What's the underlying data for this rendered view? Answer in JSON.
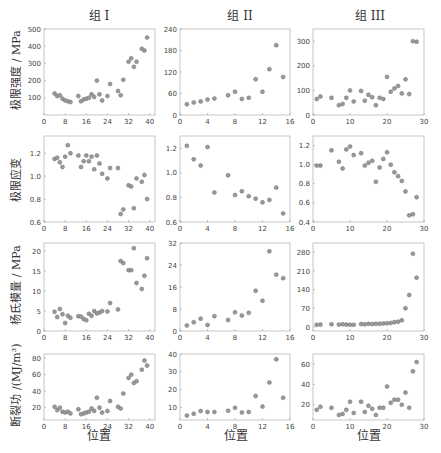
{
  "figure": {
    "column_titles": [
      "组 I",
      "组 II",
      "组 III"
    ],
    "row_labels": [
      "极限强度 / MPa",
      "极限应变",
      "杨氏模量 / MPa",
      "断裂功 /(MJ/m³)"
    ],
    "xlabel": "位置",
    "marker_color": "#9a9a9a",
    "frame_color": "#b8b8b8"
  },
  "chart_data": [
    {
      "type": "scatter",
      "panel": "组I-极限强度",
      "row": 0,
      "col": 0,
      "title": "组 I",
      "xlabel": "",
      "ylabel": "极限强度 / MPa",
      "xlim": [
        0,
        42
      ],
      "ylim": [
        0,
        500
      ],
      "xticks": [
        0,
        8,
        16,
        24,
        32,
        40
      ],
      "yticks": [
        100,
        200,
        300,
        400,
        500
      ],
      "x": [
        4,
        5,
        6,
        7,
        8,
        9,
        10,
        13,
        14,
        15,
        16,
        17,
        18,
        19,
        20,
        21,
        22,
        24,
        25,
        28,
        29,
        30,
        32,
        33,
        34,
        35,
        37,
        38,
        39
      ],
      "y": [
        125,
        110,
        115,
        95,
        85,
        80,
        75,
        110,
        80,
        90,
        95,
        100,
        120,
        105,
        200,
        120,
        85,
        110,
        180,
        140,
        115,
        205,
        310,
        330,
        280,
        310,
        385,
        375,
        450
      ]
    },
    {
      "type": "scatter",
      "panel": "组II-极限强度",
      "row": 0,
      "col": 1,
      "title": "组 II",
      "xlabel": "",
      "ylabel": "",
      "xlim": [
        0,
        16
      ],
      "ylim": [
        0,
        240
      ],
      "xticks": [
        0,
        4,
        8,
        12,
        16
      ],
      "yticks": [
        0,
        60,
        120,
        180,
        240
      ],
      "x": [
        1,
        2,
        3,
        4,
        5,
        7,
        8,
        9,
        10,
        11,
        12,
        13,
        14,
        15
      ],
      "y": [
        30,
        35,
        38,
        43,
        46,
        55,
        65,
        45,
        48,
        100,
        65,
        128,
        195,
        106
      ]
    },
    {
      "type": "scatter",
      "panel": "组III-极限强度",
      "row": 0,
      "col": 2,
      "title": "组 III",
      "xlabel": "",
      "ylabel": "",
      "xlim": [
        0,
        30
      ],
      "ylim": [
        0,
        350
      ],
      "xticks": [
        0,
        10,
        20,
        30
      ],
      "yticks": [
        0,
        100,
        200,
        300
      ],
      "x": [
        1,
        2,
        5,
        7,
        8,
        9,
        10,
        11,
        13,
        14,
        15,
        16,
        17,
        18,
        19,
        20,
        21,
        22,
        23,
        24,
        25,
        26,
        27,
        28
      ],
      "y": [
        65,
        75,
        70,
        40,
        45,
        70,
        100,
        55,
        98,
        58,
        82,
        72,
        40,
        70,
        65,
        155,
        95,
        108,
        118,
        88,
        145,
        85,
        300,
        298
      ]
    },
    {
      "type": "scatter",
      "panel": "组I-极限应变",
      "row": 1,
      "col": 0,
      "title": "",
      "xlabel": "",
      "ylabel": "极限应变",
      "xlim": [
        0,
        42
      ],
      "ylim": [
        0.6,
        1.35
      ],
      "xticks": [
        0,
        8,
        16,
        24,
        32,
        40
      ],
      "yticks": [
        0.6,
        0.8,
        1.0,
        1.2
      ],
      "x": [
        4,
        5,
        6,
        7,
        8,
        9,
        10,
        13,
        14,
        15,
        16,
        17,
        18,
        19,
        20,
        21,
        22,
        24,
        25,
        28,
        29,
        30,
        32,
        33,
        34,
        35,
        37,
        38,
        39
      ],
      "y": [
        1.15,
        1.16,
        1.12,
        1.08,
        1.17,
        1.27,
        1.2,
        1.18,
        1.08,
        1.13,
        1.18,
        1.13,
        1.17,
        1.06,
        1.18,
        1.11,
        1.02,
        0.98,
        1.07,
        1.07,
        0.67,
        0.71,
        0.92,
        0.91,
        0.72,
        0.98,
        0.95,
        1.01,
        0.8
      ]
    },
    {
      "type": "scatter",
      "panel": "组II-极限应变",
      "row": 1,
      "col": 1,
      "title": "",
      "xlabel": "",
      "ylabel": "",
      "xlim": [
        0,
        16
      ],
      "ylim": [
        0.6,
        1.3
      ],
      "xticks": [
        0,
        4,
        8,
        12,
        16
      ],
      "yticks": [
        0.6,
        0.8,
        1.0,
        1.2
      ],
      "x": [
        1,
        2,
        3,
        4,
        5,
        7,
        8,
        9,
        10,
        11,
        12,
        13,
        14,
        15
      ],
      "y": [
        1.22,
        1.11,
        1.06,
        1.21,
        0.84,
        0.98,
        0.82,
        0.85,
        0.81,
        0.79,
        0.76,
        0.78,
        0.88,
        0.67
      ]
    },
    {
      "type": "scatter",
      "panel": "组III-极限应变",
      "row": 1,
      "col": 2,
      "title": "",
      "xlabel": "",
      "ylabel": "",
      "xlim": [
        0,
        30
      ],
      "ylim": [
        0.4,
        1.3
      ],
      "xticks": [
        0,
        10,
        20,
        30
      ],
      "yticks": [
        0.4,
        0.6,
        0.8,
        1.0,
        1.2
      ],
      "x": [
        1,
        2,
        5,
        7,
        8,
        9,
        10,
        11,
        13,
        14,
        15,
        16,
        17,
        18,
        19,
        20,
        21,
        22,
        23,
        24,
        25,
        26,
        27,
        28
      ],
      "y": [
        0.99,
        0.99,
        1.15,
        1.03,
        0.96,
        1.16,
        1.19,
        1.1,
        1.12,
        0.99,
        1.02,
        1.04,
        0.82,
        0.97,
        1.06,
        1.13,
        1.0,
        0.92,
        0.88,
        0.83,
        0.72,
        0.47,
        0.48,
        0.66
      ]
    },
    {
      "type": "scatter",
      "panel": "组I-杨氏模量",
      "row": 2,
      "col": 0,
      "title": "",
      "xlabel": "",
      "ylabel": "杨氏模量 / MPa",
      "xlim": [
        0,
        42
      ],
      "ylim": [
        0,
        22
      ],
      "xticks": [
        0,
        8,
        16,
        24,
        32,
        40
      ],
      "yticks": [
        0,
        5,
        10,
        15,
        20
      ],
      "x": [
        4,
        5,
        6,
        7,
        8,
        9,
        10,
        13,
        14,
        15,
        16,
        17,
        18,
        19,
        20,
        21,
        22,
        24,
        25,
        28,
        29,
        30,
        32,
        33,
        34,
        35,
        37,
        38,
        39
      ],
      "y": [
        4.8,
        3.5,
        5.5,
        4.2,
        2.0,
        3.8,
        3.3,
        3.7,
        3.6,
        3.0,
        2.7,
        4.3,
        3.8,
        5.0,
        4.4,
        4.6,
        5.0,
        4.9,
        7.0,
        5.4,
        17.5,
        17.0,
        15.2,
        15.2,
        20.7,
        12.0,
        10.5,
        13.8,
        18.2
      ]
    },
    {
      "type": "scatter",
      "panel": "组II-杨氏模量",
      "row": 2,
      "col": 1,
      "title": "",
      "xlabel": "",
      "ylabel": "",
      "xlim": [
        0,
        16
      ],
      "ylim": [
        0,
        32
      ],
      "xticks": [
        0,
        4,
        8,
        12,
        16
      ],
      "yticks": [
        0,
        8,
        16,
        24,
        32
      ],
      "x": [
        1,
        2,
        3,
        4,
        5,
        7,
        8,
        9,
        10,
        11,
        12,
        13,
        14,
        15
      ],
      "y": [
        2.0,
        3.2,
        4.5,
        2.2,
        5.4,
        4.0,
        6.8,
        5.6,
        6.6,
        14.6,
        11.0,
        29.0,
        20.5,
        19.2
      ]
    },
    {
      "type": "scatter",
      "panel": "组III-杨氏模量",
      "row": 2,
      "col": 2,
      "title": "",
      "xlabel": "",
      "ylabel": "",
      "xlim": [
        0,
        30
      ],
      "ylim": [
        -15,
        315
      ],
      "xticks": [
        0,
        10,
        20,
        30
      ],
      "yticks": [
        0,
        70,
        140,
        210,
        280
      ],
      "x": [
        1,
        2,
        5,
        7,
        8,
        9,
        10,
        11,
        13,
        14,
        15,
        16,
        17,
        18,
        19,
        20,
        21,
        22,
        23,
        24,
        25,
        26,
        27,
        28
      ],
      "y": [
        8,
        9,
        10,
        9,
        10,
        9,
        8,
        8,
        11,
        10,
        12,
        11,
        12,
        12,
        13,
        14,
        15,
        18,
        20,
        25,
        70,
        120,
        275,
        185
      ]
    },
    {
      "type": "scatter",
      "panel": "组I-断裂功",
      "row": 3,
      "col": 0,
      "title": "",
      "xlabel": "位置",
      "ylabel": "断裂功 /(MJ/m³)",
      "xlim": [
        0,
        42
      ],
      "ylim": [
        5,
        85
      ],
      "xticks": [
        0,
        8,
        16,
        24,
        32,
        40
      ],
      "yticks": [
        20,
        40,
        60,
        80
      ],
      "x": [
        4,
        5,
        6,
        7,
        8,
        9,
        10,
        13,
        14,
        15,
        16,
        17,
        18,
        19,
        20,
        21,
        22,
        24,
        25,
        28,
        29,
        30,
        32,
        33,
        34,
        35,
        37,
        38,
        39
      ],
      "y": [
        21,
        17,
        20,
        15,
        14,
        15,
        13,
        18,
        12,
        13,
        14,
        15,
        19,
        16,
        32,
        20,
        14,
        16,
        28,
        21,
        19,
        37,
        56,
        60,
        50,
        52,
        66,
        77,
        71
      ]
    },
    {
      "type": "scatter",
      "panel": "组II-断裂功",
      "row": 3,
      "col": 1,
      "title": "",
      "xlabel": "位置",
      "ylabel": "",
      "xlim": [
        0,
        16
      ],
      "ylim": [
        3,
        40
      ],
      "xticks": [
        0,
        4,
        8,
        12,
        16
      ],
      "yticks": [
        10,
        20,
        30,
        40
      ],
      "x": [
        1,
        2,
        3,
        4,
        5,
        7,
        8,
        9,
        10,
        11,
        12,
        13,
        14,
        15
      ],
      "y": [
        5.5,
        6.5,
        8.0,
        7.5,
        7.5,
        8.2,
        9.8,
        7.2,
        7.5,
        16.5,
        10.5,
        24.0,
        37.0,
        15.5
      ]
    },
    {
      "type": "scatter",
      "panel": "组III-断裂功",
      "row": 3,
      "col": 2,
      "title": "",
      "xlabel": "位置",
      "ylabel": "",
      "xlim": [
        0,
        30
      ],
      "ylim": [
        5,
        70
      ],
      "xticks": [
        0,
        10,
        20,
        30
      ],
      "yticks": [
        20,
        40,
        60
      ],
      "x": [
        1,
        2,
        5,
        7,
        8,
        9,
        10,
        11,
        13,
        14,
        15,
        16,
        17,
        18,
        19,
        20,
        21,
        22,
        23,
        24,
        25,
        26,
        27,
        28
      ],
      "y": [
        15,
        18,
        17,
        10,
        11,
        15,
        23,
        12,
        23,
        13,
        19,
        16,
        10,
        17,
        17,
        38,
        22,
        25,
        25,
        20,
        32,
        17,
        53,
        62
      ]
    }
  ]
}
